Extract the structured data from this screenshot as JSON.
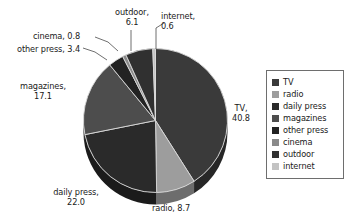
{
  "chart_data": {
    "type": "pie",
    "title": "",
    "subtitle": "",
    "xlabel": "",
    "ylabel": "",
    "units": "percent",
    "total": 99.5,
    "grid": false,
    "legend_position": "right",
    "three_d": true,
    "start_angle_deg": -90,
    "direction": "clockwise",
    "categories": [
      "TV",
      "radio",
      "daily press",
      "magazines",
      "other press",
      "cinema",
      "outdoor",
      "internet"
    ],
    "values": [
      40.8,
      8.7,
      22.0,
      17.1,
      3.4,
      0.8,
      6.1,
      0.6
    ],
    "colors": [
      "#3a3a3a",
      "#9d9d9d",
      "#2a2a2a",
      "#4d4d4d",
      "#222222",
      "#8a8a8a",
      "#303030",
      "#c3c3c3"
    ],
    "slices": [
      {
        "name": "TV",
        "value": 40.8,
        "label": "TV,\n40.8",
        "color": "#3a3a3a"
      },
      {
        "name": "radio",
        "value": 8.7,
        "label": "radio, 8.7",
        "color": "#9d9d9d"
      },
      {
        "name": "daily press",
        "value": 22.0,
        "label": "daily press,\n22.0",
        "color": "#2a2a2a"
      },
      {
        "name": "magazines",
        "value": 17.1,
        "label": "magazines,\n17.1",
        "color": "#4d4d4d"
      },
      {
        "name": "other press",
        "value": 3.4,
        "label": "other press, 3.4",
        "color": "#222222"
      },
      {
        "name": "cinema",
        "value": 0.8,
        "label": "cinema, 0.8",
        "color": "#8a8a8a"
      },
      {
        "name": "outdoor",
        "value": 6.1,
        "label": "outdoor,\n6.1",
        "color": "#303030"
      },
      {
        "name": "internet",
        "value": 0.6,
        "label": "internet,\n0.6",
        "color": "#c3c3c3"
      }
    ],
    "data_labels": {
      "tv": {
        "line1": "TV,",
        "line2": "40.8"
      },
      "radio": {
        "line1": "radio, 8.7",
        "line2": ""
      },
      "daily_press": {
        "line1": "daily press,",
        "line2": "22.0"
      },
      "magazines": {
        "line1": "magazines,",
        "line2": "17.1"
      },
      "other_press": {
        "line1": "other press, 3.4",
        "line2": ""
      },
      "cinema": {
        "line1": "cinema, 0.8",
        "line2": ""
      },
      "outdoor": {
        "line1": "outdoor,",
        "line2": "6.1"
      },
      "internet": {
        "line1": "internet,",
        "line2": "0.6"
      }
    }
  },
  "legend": {
    "items": [
      {
        "label": "TV",
        "color": "#3a3a3a"
      },
      {
        "label": "radio",
        "color": "#9d9d9d"
      },
      {
        "label": "daily press",
        "color": "#2a2a2a"
      },
      {
        "label": "magazines",
        "color": "#4d4d4d"
      },
      {
        "label": "other press",
        "color": "#222222"
      },
      {
        "label": "cinema",
        "color": "#8a8a8a"
      },
      {
        "label": "outdoor",
        "color": "#303030"
      },
      {
        "label": "internet",
        "color": "#c3c3c3"
      }
    ]
  }
}
